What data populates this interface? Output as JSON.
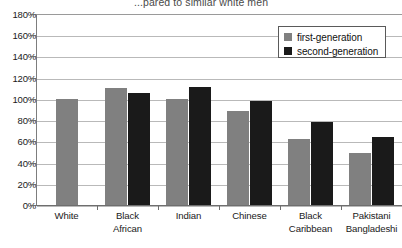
{
  "chart_data": {
    "type": "bar",
    "title": "...pared to similar white men",
    "xlabel": "",
    "ylabel": "",
    "ylim": [
      0,
      180
    ],
    "ytick_step": 20,
    "grid": true,
    "legend_position": "top-right",
    "categories": [
      "White",
      "Black African",
      "Indian",
      "Chinese",
      "Black Caribbean",
      "Pakistani Bangladeshi"
    ],
    "category_lines": [
      [
        "White"
      ],
      [
        "Black",
        "African"
      ],
      [
        "Indian"
      ],
      [
        "Chinese"
      ],
      [
        "Black",
        "Caribbean"
      ],
      [
        "Pakistani",
        "Bangladeshi"
      ]
    ],
    "ytick_labels": [
      "0%",
      "20%",
      "40%",
      "60%",
      "80%",
      "100%",
      "120%",
      "140%",
      "160%",
      "180%"
    ],
    "ytick_values": [
      0,
      20,
      40,
      60,
      80,
      100,
      120,
      140,
      160,
      180
    ],
    "series": [
      {
        "name": "first-generation",
        "color": "#808080",
        "values": [
          100,
          110,
          100,
          89,
          62,
          49
        ]
      },
      {
        "name": "second-generation",
        "color": "#1a1a1a",
        "values": [
          null,
          106,
          111,
          98,
          78,
          64
        ]
      }
    ]
  },
  "legend": {
    "items": [
      {
        "label": "first-generation",
        "swatch": "first"
      },
      {
        "label": "second-generation",
        "swatch": "second"
      }
    ]
  },
  "colors": {
    "first_generation": "#808080",
    "second_generation": "#1a1a1a",
    "gridline": "#b9b9b9",
    "axis": "#6e6e6e"
  }
}
